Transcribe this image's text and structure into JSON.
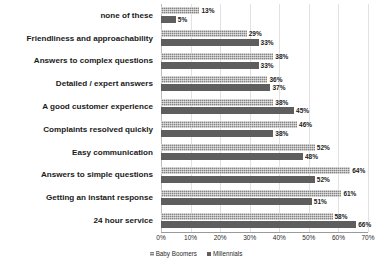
{
  "chart_data": {
    "type": "bar",
    "orientation": "horizontal",
    "title": "",
    "subtitle": "",
    "xlabel": "",
    "ylabel": "",
    "xlim": [
      0,
      70
    ],
    "grid": true,
    "legend_position": "bottom",
    "value_suffix": "%",
    "tick_labels": [
      "0%",
      "10%",
      "20%",
      "30%",
      "40%",
      "50%",
      "60%",
      "70%"
    ],
    "ticks": [
      0,
      10,
      20,
      30,
      40,
      50,
      60,
      70
    ],
    "categories": [
      "none of these",
      "Friendliness and approachability",
      "Answers to complex questions",
      "Detailed / expert answers",
      "A good customer experience",
      "Complaints resolved quickly",
      "Easy communication",
      "Answers to simple questions",
      "Getting an instant response",
      "24 hour service"
    ],
    "series": [
      {
        "name": "Baby Boomers",
        "color": "#848484",
        "values": [
          13,
          29,
          38,
          36,
          38,
          46,
          52,
          64,
          61,
          58
        ],
        "labels": [
          "13%",
          "29%",
          "38%",
          "36%",
          "38%",
          "46%",
          "52%",
          "64%",
          "61%",
          "58%"
        ]
      },
      {
        "name": "Millennials",
        "color": "#5e5e5e",
        "values": [
          5,
          33,
          33,
          37,
          45,
          38,
          48,
          52,
          51,
          66
        ],
        "labels": [
          "5%",
          "33%",
          "33%",
          "37%",
          "45%",
          "38%",
          "48%",
          "52%",
          "51%",
          "66%"
        ]
      }
    ]
  }
}
